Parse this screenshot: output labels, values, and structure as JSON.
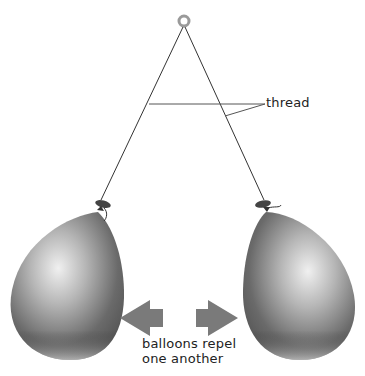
{
  "diagram": {
    "title": "",
    "labels": {
      "thread": "thread",
      "caption_line1": "balloons repel",
      "caption_line2": "one another"
    },
    "elements": [
      {
        "id": "support-ring",
        "type": "ring",
        "x": 184,
        "y": 22
      },
      {
        "id": "thread-left",
        "type": "line",
        "from": [
          184,
          26
        ],
        "to": [
          100,
          200
        ]
      },
      {
        "id": "thread-right",
        "type": "line",
        "from": [
          184,
          26
        ],
        "to": [
          265,
          200
        ]
      },
      {
        "id": "balloon-left",
        "type": "balloon"
      },
      {
        "id": "balloon-right",
        "type": "balloon"
      },
      {
        "id": "arrow-left",
        "type": "arrow",
        "direction": "left"
      },
      {
        "id": "arrow-right",
        "type": "arrow",
        "direction": "right"
      }
    ],
    "colors": {
      "background": "#ffffff",
      "thread": "#333333",
      "balloon_dark": "#4a4a4a",
      "balloon_light": "#e8e8e8",
      "arrow": "#7a7a7a",
      "text": "#222222"
    }
  }
}
